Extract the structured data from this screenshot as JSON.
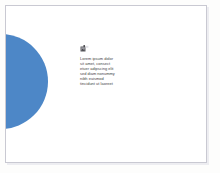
{
  "slide": {
    "background_color": "#ffffff",
    "page_background_color": "#fdfdfc",
    "border_color": "#c9c9d2",
    "decor": {
      "shape": "circle",
      "color": "#4d87c7",
      "name": "blue-circle-decoration"
    },
    "icon": {
      "name": "image-thumbnail-icon",
      "color": "#4a4a4a"
    },
    "text_block": {
      "color": "#3d3d42",
      "lines": [
        "Lorem ipsum dolor",
        "sit amet, consect",
        "etuer adipscing elit",
        "sed diam nonummy",
        "nibh euismod",
        "tincidunt ut laoreet"
      ]
    }
  }
}
